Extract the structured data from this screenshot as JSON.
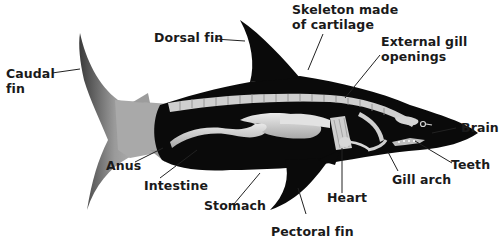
{
  "diagram": {
    "labels": {
      "caudal_fin_1": "Caudal",
      "caudal_fin_2": "fin",
      "dorsal_fin": "Dorsal fin",
      "skeleton_1": "Skeleton made",
      "skeleton_2": "of cartilage",
      "gill_openings_1": "External gill",
      "gill_openings_2": "openings",
      "brain": "Brain",
      "teeth": "Teeth",
      "gill_arch": "Gill arch",
      "heart": "Heart",
      "pectoral_fin": "Pectoral fin",
      "stomach": "Stomach",
      "intestine": "Intestine",
      "anus": "Anus"
    },
    "colors": {
      "body": "#0a0a0a",
      "organs": "#d9d9d9",
      "tail": "#8a8a8a",
      "text": "#1a1a1a",
      "leader": "#222222"
    }
  }
}
